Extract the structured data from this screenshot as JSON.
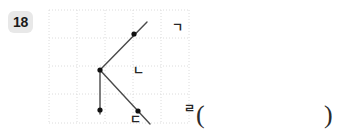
{
  "problem": {
    "number": "18"
  },
  "figure": {
    "grid": {
      "columns": 5,
      "rows": 4,
      "cell_size": 28,
      "line_color": "#dcdcdc",
      "border_color": "#d0d0d0",
      "style": "dotted"
    },
    "stroke_color": "#4a4a4a",
    "point_color": "#111111",
    "labels": {
      "top_right": "ㄱ",
      "vertex": "ㄴ",
      "bottom": "ㄷ",
      "lower_right": "ㄹ"
    },
    "points": [
      {
        "name": "ㄱ",
        "x": 86,
        "y": 26
      },
      {
        "name": "ㄴ",
        "x": 52,
        "y": 62
      },
      {
        "name": "ㄷ",
        "x": 52,
        "y": 102
      },
      {
        "name": "ㄹ",
        "x": 90,
        "y": 103
      }
    ],
    "segments": [
      {
        "from": "ㄴ",
        "to": "ㄱ",
        "type": "ray"
      },
      {
        "from": "ㄴ",
        "to": "ㄹ",
        "type": "ray"
      },
      {
        "from": "ㄴ",
        "to": "ㄷ",
        "type": "segment"
      }
    ]
  },
  "answer": {
    "open_paren": "(",
    "close_paren": ")",
    "value": ""
  }
}
